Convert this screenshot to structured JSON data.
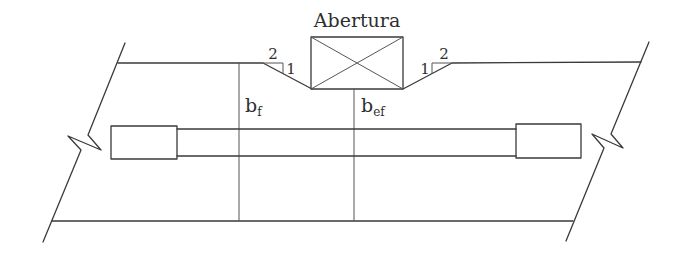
{
  "diagram": {
    "title": "Abertura",
    "labels": {
      "bf_main": "b",
      "bf_sub": "f",
      "bef_main": "b",
      "bef_sub": "ef"
    },
    "slope_left": {
      "horizontal": "2",
      "vertical": "1"
    },
    "slope_right": {
      "horizontal": "2",
      "vertical": "1"
    },
    "colors": {
      "line": "#3a3a3a",
      "text": "#2e2e2e",
      "background": "#ffffff"
    },
    "elements": [
      "slab top edge",
      "slab bottom edge",
      "break lines left and right",
      "opening (Abertura) box with cross",
      "2:1 spread slopes from opening corners",
      "beam with end supports",
      "effective width reference lines b_f and b_ef"
    ]
  }
}
